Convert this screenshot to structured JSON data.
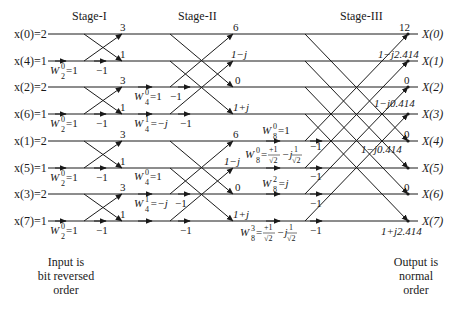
{
  "diagram": {
    "stages": [
      {
        "label": "Stage-I"
      },
      {
        "label": "Stage-II"
      },
      {
        "label": "Stage-III"
      }
    ],
    "inputs": [
      {
        "label": "x(0)=2",
        "name": "x(0)",
        "value": "2"
      },
      {
        "label": "x(4)=1",
        "name": "x(4)",
        "value": "1"
      },
      {
        "label": "x(2)=2",
        "name": "x(2)",
        "value": "2"
      },
      {
        "label": "x(6)=1",
        "name": "x(6)",
        "value": "1"
      },
      {
        "label": "x(1)=2",
        "name": "x(1)",
        "value": "2"
      },
      {
        "label": "x(5)=1",
        "name": "x(5)",
        "value": "1"
      },
      {
        "label": "x(3)=2",
        "name": "x(3)",
        "value": "2"
      },
      {
        "label": "x(7)=1",
        "name": "x(7)",
        "value": "1"
      }
    ],
    "outputs": [
      {
        "label": "X(0)",
        "value": "12"
      },
      {
        "label": "X(1)",
        "value": "1−j2.414"
      },
      {
        "label": "X(2)",
        "value": "0"
      },
      {
        "label": "X(3)",
        "value": "1−j0.414"
      },
      {
        "label": "X(4)",
        "value": "0"
      },
      {
        "label": "X(5)",
        "value": "1−j0.414"
      },
      {
        "label": "X(6)",
        "value": "0"
      },
      {
        "label": "X(7)",
        "value": "1+j2.414"
      }
    ],
    "stage1_results": [
      "3",
      "1",
      "3",
      "1",
      "3",
      "1",
      "3",
      "1"
    ],
    "stage2_results": [
      "6",
      "1−j",
      "0",
      "1+j",
      "6",
      "1−j",
      "0",
      "1+j"
    ],
    "twiddles": {
      "stage1": [
        "W₂⁰=1",
        "W₂⁰=1",
        "W₂⁰=1",
        "W₂⁰=1"
      ],
      "stage2": [
        "W₄⁰=1",
        "W₄¹=−j",
        "W₄⁰=1",
        "W₄¹=−j"
      ],
      "stage3": [
        "W₈⁰=1",
        "W₈⁰=+1/√2 − j1/√2",
        "W₈²=j",
        "W₈³=+1/√2 − j1/√2"
      ]
    },
    "minus_one": "−1",
    "tw": {
      "W": "W",
      "eq1": "=1",
      "eqmj": "=−j",
      "eqj": "=j",
      "p1": "+1",
      "one": "1",
      "sqrt2": "√2",
      "mj": "−j",
      "eq": "=",
      "sub2": "2",
      "sub4": "4",
      "sub8": "8",
      "sup0": "0",
      "sup1": "1",
      "sup2": "2",
      "sup3": "3"
    },
    "input_caption": [
      "Input is",
      "bit reversed",
      "order"
    ],
    "output_caption": [
      "Output is",
      "normal",
      "order"
    ]
  }
}
